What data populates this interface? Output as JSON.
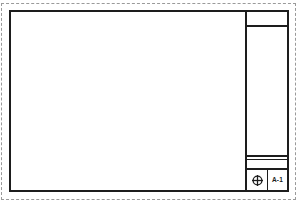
{
  "sheet": {
    "type": "architectural-drawing-sheet",
    "orientation": "landscape",
    "background_color": "#ffffff",
    "line_color": "#1d1d1d",
    "trim_line_color": "#9a9a9a"
  },
  "trim_boundary": {
    "label": "",
    "style": "dashed"
  },
  "drawing_field": {
    "label": "",
    "content": ""
  },
  "title_block": {
    "header_cell": {
      "label": ""
    },
    "body_cell": {
      "label": ""
    },
    "strip_cell": {
      "label": ""
    },
    "revision_cell": {
      "label": ""
    },
    "footer": {
      "logo": {
        "icon": "target-crosshair-icon",
        "label": ""
      },
      "sheet_number": "A-1"
    }
  }
}
